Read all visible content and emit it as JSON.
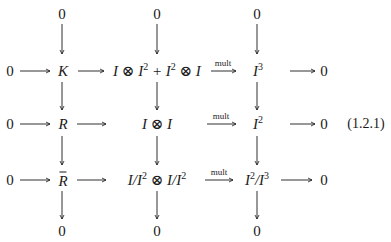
{
  "diagram": {
    "type": "commutative-diagram",
    "equation_label": "(1.2.1)",
    "top_row": [
      "0",
      "0",
      "0"
    ],
    "bottom_row": [
      "0",
      "0",
      "0"
    ],
    "rows": [
      {
        "left_zero": "0",
        "col1": "K",
        "col2": {
          "part1": "I ⊗ I",
          "sup1": "2",
          "plus": " + I",
          "sup2": "2",
          "part2": " ⊗ I"
        },
        "arrow_label": "mult",
        "col3": {
          "base": "I",
          "sup": "3"
        },
        "right_zero": "0"
      },
      {
        "left_zero": "0",
        "col1": "R",
        "col2": {
          "text": "I ⊗ I"
        },
        "arrow_label": "mult",
        "col3": {
          "base": "I",
          "sup": "2"
        },
        "right_zero": "0"
      },
      {
        "left_zero": "0",
        "col1": "R",
        "col1_decoration": "bar",
        "col2": {
          "a": "I/I",
          "sup1": "2",
          "b": " ⊗ I/I",
          "sup2": "2"
        },
        "arrow_label": "mult",
        "col3": {
          "a": "I",
          "sup1": "2",
          "b": "/I",
          "sup2": "3"
        },
        "right_zero": "0"
      }
    ]
  }
}
